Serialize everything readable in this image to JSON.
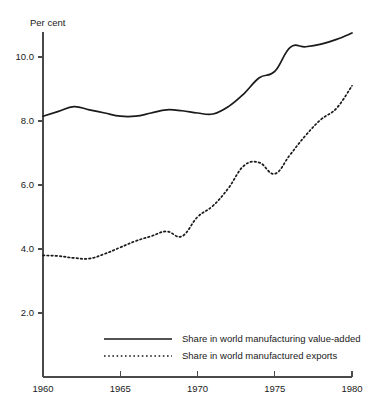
{
  "chart_data": {
    "type": "line",
    "title": "",
    "subtitle": "",
    "xlabel": "",
    "ylabel": "Per cent",
    "ylabel_position": "top-left",
    "grid": false,
    "legend_position": "bottom-center-inside",
    "xlim": [
      1960,
      1980
    ],
    "ylim": [
      0.0,
      11.4
    ],
    "x_ticks": [
      1960,
      1965,
      1970,
      1975,
      1980
    ],
    "x_tick_labels": [
      "1960",
      "1965",
      "1970",
      "1975",
      "1980"
    ],
    "y_ticks": [
      2.0,
      4.0,
      6.0,
      8.0,
      10.0
    ],
    "y_tick_labels": [
      "2.0",
      "4.0",
      "6.0",
      "8.0",
      "10.0"
    ],
    "x": [
      1960,
      1961,
      1962,
      1963,
      1964,
      1965,
      1966,
      1967,
      1968,
      1969,
      1970,
      1971,
      1972,
      1973,
      1974,
      1975,
      1976,
      1977,
      1978,
      1979,
      1980
    ],
    "series": [
      {
        "name": "Share in world manufacturing value-added",
        "style": "solid",
        "color": "#1a1a1a",
        "values": [
          8.15,
          8.3,
          8.45,
          8.35,
          8.25,
          8.15,
          8.15,
          8.25,
          8.35,
          8.32,
          8.25,
          8.22,
          8.45,
          8.85,
          9.35,
          9.55,
          10.3,
          10.32,
          10.4,
          10.55,
          10.75
        ]
      },
      {
        "name": "Share in world manufactured exports",
        "style": "dotted",
        "color": "#1a1a1a",
        "values": [
          3.8,
          3.78,
          3.72,
          3.7,
          3.85,
          4.05,
          4.25,
          4.4,
          4.55,
          4.4,
          5.0,
          5.35,
          5.9,
          6.6,
          6.7,
          6.35,
          6.95,
          7.55,
          8.05,
          8.4,
          9.1
        ]
      }
    ]
  },
  "legend": {
    "entries": [
      {
        "label": "Share in world manufacturing value-added",
        "style": "solid"
      },
      {
        "label": "Share in world manufactured exports",
        "style": "dotted"
      }
    ]
  }
}
